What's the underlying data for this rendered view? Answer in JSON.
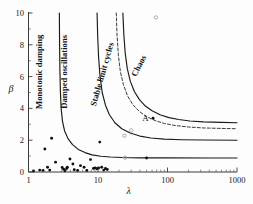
{
  "figure": {
    "background_color": "#fdfdfd",
    "foreground_color": "#1a1a1a"
  },
  "chart_data": {
    "type": "line",
    "title": "",
    "xlabel": "λ",
    "ylabel": "β",
    "xscale": "log",
    "yscale": "linear",
    "xlim": [
      1,
      1000
    ],
    "ylim": [
      0,
      10
    ],
    "grid": false,
    "legend": "none",
    "xticks": [
      1,
      10,
      100,
      1000
    ],
    "xtick_labels": [
      "1",
      "10",
      "100",
      "1000"
    ],
    "yticks": [
      0,
      2,
      4,
      6,
      8,
      10
    ],
    "ytick_labels": [
      "0",
      "2",
      "4",
      "6",
      "8",
      "10"
    ],
    "yticks_minor": [
      1,
      3,
      5,
      7,
      9
    ],
    "region_labels": [
      {
        "text": "Monotonic damping",
        "x": 1.55,
        "y": 6.3,
        "rotation": -90
      },
      {
        "text": "Damped oscillations",
        "x": 3.6,
        "y": 6.3,
        "rotation": -90
      },
      {
        "text": "Stable limit cycles",
        "x": 12.5,
        "y": 6.1,
        "rotation": -74
      },
      {
        "text": "Chaos",
        "x": 42.0,
        "y": 6.6,
        "rotation": -62
      }
    ],
    "annotations": [
      {
        "text": "A",
        "x": 48.0,
        "y": 3.4,
        "marker": "filled-dot"
      }
    ],
    "series": [
      {
        "name": "monotonic-damped boundary",
        "style": "solid",
        "asymptote_beta": 0.88,
        "asymptote_lambda": 2.75,
        "points": [
          [
            2.78,
            10.0
          ],
          [
            2.8,
            8.0
          ],
          [
            2.83,
            6.4
          ],
          [
            2.88,
            5.0
          ],
          [
            2.95,
            4.0
          ],
          [
            3.08,
            3.2
          ],
          [
            3.3,
            2.6
          ],
          [
            3.7,
            2.1
          ],
          [
            4.3,
            1.72
          ],
          [
            5.2,
            1.42
          ],
          [
            6.5,
            1.22
          ],
          [
            8.2,
            1.08
          ],
          [
            11.0,
            0.99
          ],
          [
            15.0,
            0.94
          ],
          [
            22.0,
            0.91
          ],
          [
            40.0,
            0.89
          ],
          [
            100.0,
            0.885
          ],
          [
            400.0,
            0.88
          ],
          [
            1000.0,
            0.88
          ]
        ]
      },
      {
        "name": "damped-limitcycle boundary",
        "style": "solid",
        "asymptote_beta": 2.0,
        "asymptote_lambda": 9.5,
        "points": [
          [
            9.7,
            10.0
          ],
          [
            9.9,
            8.5
          ],
          [
            10.2,
            7.2
          ],
          [
            10.7,
            6.0
          ],
          [
            11.5,
            5.0
          ],
          [
            12.8,
            4.2
          ],
          [
            14.6,
            3.6
          ],
          [
            17.5,
            3.1
          ],
          [
            22.0,
            2.72
          ],
          [
            29.0,
            2.45
          ],
          [
            40.0,
            2.26
          ],
          [
            58.0,
            2.14
          ],
          [
            90.0,
            2.07
          ],
          [
            160.0,
            2.03
          ],
          [
            330.0,
            2.01
          ],
          [
            1000.0,
            2.0
          ]
        ]
      },
      {
        "name": "limitcycle-chaos boundary (dashed)",
        "style": "dashed",
        "asymptote_beta": 2.72,
        "asymptote_lambda": 18.0,
        "points": [
          [
            18.3,
            10.0
          ],
          [
            18.8,
            8.6
          ],
          [
            19.6,
            7.4
          ],
          [
            21.0,
            6.3
          ],
          [
            23.2,
            5.5
          ],
          [
            26.5,
            4.8
          ],
          [
            31.5,
            4.25
          ],
          [
            39.0,
            3.82
          ],
          [
            50.0,
            3.48
          ],
          [
            66.0,
            3.24
          ],
          [
            90.0,
            3.05
          ],
          [
            130.0,
            2.92
          ],
          [
            200.0,
            2.83
          ],
          [
            330.0,
            2.77
          ],
          [
            600.0,
            2.74
          ],
          [
            1000.0,
            2.72
          ]
        ]
      },
      {
        "name": "chaos onset boundary",
        "style": "solid",
        "asymptote_beta": 3.1,
        "asymptote_lambda": 22.5,
        "points": [
          [
            22.8,
            10.0
          ],
          [
            23.5,
            8.7
          ],
          [
            24.6,
            7.5
          ],
          [
            26.4,
            6.5
          ],
          [
            29.2,
            5.7
          ],
          [
            33.5,
            5.05
          ],
          [
            39.5,
            4.55
          ],
          [
            48.0,
            4.15
          ],
          [
            60.0,
            3.85
          ],
          [
            78.0,
            3.6
          ],
          [
            105.0,
            3.42
          ],
          [
            145.0,
            3.3
          ],
          [
            210.0,
            3.21
          ],
          [
            330.0,
            3.15
          ],
          [
            600.0,
            3.12
          ],
          [
            1000.0,
            3.1
          ]
        ]
      }
    ],
    "scatter_filled": {
      "name": "observed populations (filled)",
      "marker": "filled-circle",
      "points": [
        [
          1.18,
          0.06
        ],
        [
          1.45,
          0.12
        ],
        [
          1.62,
          0.1
        ],
        [
          1.72,
          1.45
        ],
        [
          1.88,
          0.3
        ],
        [
          2.02,
          0.12
        ],
        [
          2.15,
          2.12
        ],
        [
          2.45,
          0.62
        ],
        [
          3.05,
          0.28
        ],
        [
          3.2,
          0.18
        ],
        [
          3.35,
          0.08
        ],
        [
          3.55,
          0.22
        ],
        [
          3.62,
          0.3
        ],
        [
          3.95,
          0.82
        ],
        [
          4.35,
          0.5
        ],
        [
          4.55,
          0.14
        ],
        [
          5.1,
          0.1
        ],
        [
          5.6,
          0.4
        ],
        [
          6.3,
          0.3
        ],
        [
          6.9,
          0.1
        ],
        [
          7.8,
          0.78
        ],
        [
          8.6,
          0.22
        ],
        [
          9.1,
          0.26
        ],
        [
          9.6,
          0.2
        ],
        [
          10.2,
          0.25
        ],
        [
          10.6,
          1.88
        ],
        [
          11.3,
          0.3
        ],
        [
          12.1,
          0.12
        ],
        [
          12.8,
          0.22
        ],
        [
          13.6,
          0.16
        ],
        [
          50.0,
          0.88
        ],
        [
          62.0,
          3.38
        ]
      ]
    },
    "scatter_open": {
      "name": "additional points (open)",
      "marker": "open-circle",
      "points": [
        [
          24.0,
          2.28
        ],
        [
          24.5,
          0.9
        ],
        [
          30.0,
          2.62
        ],
        [
          68.0,
          9.72
        ]
      ]
    }
  }
}
